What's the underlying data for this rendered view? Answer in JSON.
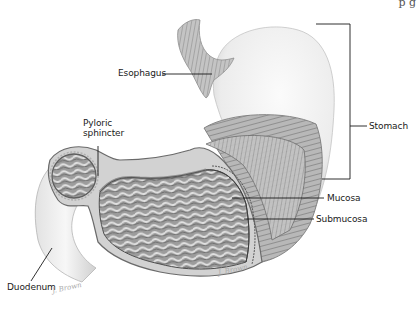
{
  "diagram": {
    "corner_fragment": "p g",
    "labels": {
      "esophagus": "Esophagus",
      "pyloric_sphincter": "Pyloric sphincter",
      "stomach": "Stomach",
      "mucosa": "Mucosa",
      "submucosa": "Submucosa",
      "duodenum": "Duodenum"
    },
    "signatures": {
      "bottom_left": "J. Brown",
      "bottom_center": "J. Brown"
    },
    "colors": {
      "background": "#ffffff",
      "leader_line": "#1a1a1a",
      "outer_wall": "#e9e9e9",
      "muscle_band": "#9a9a9a",
      "mucosa_folds": "#7a7a7a",
      "label_text": "#1a1a1a"
    }
  }
}
